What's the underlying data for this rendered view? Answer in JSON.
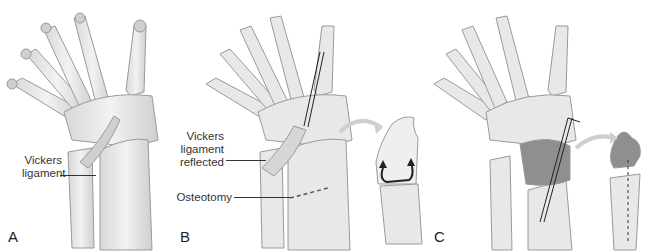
{
  "figure": {
    "panels": [
      {
        "letter": "A",
        "labels": [
          {
            "line1": "Vickers",
            "line2": "ligament"
          }
        ]
      },
      {
        "letter": "B",
        "labels": [
          {
            "line1": "Vickers",
            "line2": "ligament",
            "line3": "reflected"
          },
          {
            "line1": "Osteotomy"
          }
        ]
      },
      {
        "letter": "C",
        "labels": []
      }
    ]
  },
  "colors": {
    "bone": "#e6e6e6",
    "bone_shadow": "#b8b8b8",
    "outline": "#9a9a9a",
    "wedge": "#8f8f8f",
    "arrow": "#c9c9c9"
  }
}
